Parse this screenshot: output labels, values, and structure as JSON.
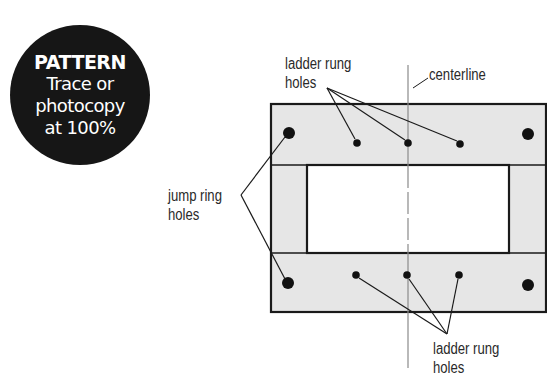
{
  "badge": {
    "title": "PATTERN",
    "line1": "Trace or",
    "line2": "photocopy",
    "line3": "at 100%"
  },
  "labels": {
    "top_ladder_line1": "ladder rung",
    "top_ladder_line2": "holes",
    "centerline": "centerline",
    "jump_line1": "jump ring",
    "jump_line2": "holes",
    "bottom_ladder_line1": "ladder rung",
    "bottom_ladder_line2": "holes"
  },
  "colors": {
    "frame_fill": "#e6e6e6",
    "stroke": "#1a1a1a",
    "centerline": "#8a8a8a",
    "badge": "#161616"
  }
}
